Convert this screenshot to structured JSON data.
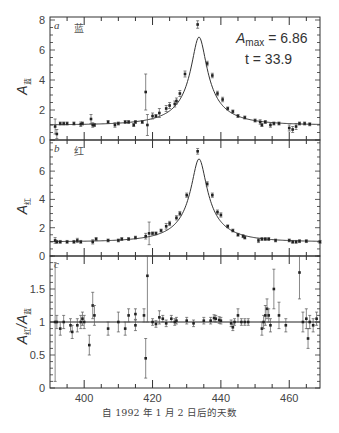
{
  "chart_data": {
    "type": "scatter",
    "xlabel": "自 1992 年 1 月 2 日后的天数",
    "xlim": [
      390,
      469
    ],
    "xticks": [
      400,
      420,
      440,
      460
    ],
    "panels": [
      {
        "id": "a",
        "panel_letter": "a",
        "band_label": "蓝",
        "ylabel_main": "A",
        "ylabel_sub": "蓝",
        "ylim": [
          0,
          8.2
        ],
        "yticks": [
          0,
          2,
          4,
          6,
          8
        ],
        "annotation": {
          "amax_label": "A",
          "amax_sub": "max",
          "amax_value": "= 6.86",
          "t_label": "t = 33.9"
        },
        "fit": {
          "t0": 433.6,
          "amax": 6.86,
          "tE": 33.9,
          "u_shape": "paczynski"
        },
        "points": [
          [
            391.5,
            0.9,
            0.5
          ],
          [
            392,
            0.4,
            0.3
          ],
          [
            393,
            1.1,
            0.1
          ],
          [
            394,
            1.1,
            0.1
          ],
          [
            395,
            1.1,
            0.1
          ],
          [
            397,
            1.1,
            0.1
          ],
          [
            399,
            1.05,
            0.15
          ],
          [
            399.5,
            1.1,
            0.1
          ],
          [
            402,
            1.4,
            0.3
          ],
          [
            402.5,
            1.0,
            0.15
          ],
          [
            403,
            1.0,
            0.1
          ],
          [
            407,
            1.2,
            0.1
          ],
          [
            409,
            1.0,
            0.15
          ],
          [
            410,
            1.1,
            0.1
          ],
          [
            412,
            1.2,
            0.1
          ],
          [
            413,
            1.2,
            0.1
          ],
          [
            414.5,
            1.0,
            0.1
          ],
          [
            415,
            1.2,
            0.1
          ],
          [
            417,
            1.2,
            0.1
          ],
          [
            418,
            3.2,
            1.2
          ],
          [
            418.5,
            1.0,
            0.7
          ],
          [
            420,
            1.6,
            0.2
          ],
          [
            421,
            1.6,
            0.1
          ],
          [
            422,
            1.8,
            0.3
          ],
          [
            424,
            2.1,
            0.2
          ],
          [
            425,
            2.3,
            0.2
          ],
          [
            426.5,
            2.4,
            0.2
          ],
          [
            427,
            2.6,
            0.2
          ],
          [
            428,
            3.1,
            0.2
          ],
          [
            429.5,
            4.4,
            0.2
          ],
          [
            433.2,
            7.7,
            0.25
          ],
          [
            436,
            5.1,
            0.15
          ],
          [
            437.5,
            4.3,
            0.15
          ],
          [
            439,
            3.1,
            0.15
          ],
          [
            440.5,
            2.7,
            0.15
          ],
          [
            442,
            2.1,
            0.1
          ],
          [
            443.5,
            1.9,
            0.1
          ],
          [
            445,
            1.6,
            0.1
          ],
          [
            447,
            1.5,
            0.1
          ],
          [
            450,
            1.3,
            0.1
          ],
          [
            451.5,
            1.2,
            0.15
          ],
          [
            452,
            1.0,
            0.1
          ],
          [
            453,
            1.2,
            0.1
          ],
          [
            454.5,
            1.0,
            0.15
          ],
          [
            455.5,
            1.1,
            0.1
          ],
          [
            457,
            1.1,
            0.1
          ],
          [
            460,
            0.8,
            0.2
          ],
          [
            461,
            0.7,
            0.2
          ],
          [
            462,
            0.9,
            0.2
          ],
          [
            463,
            1.1,
            0.1
          ],
          [
            464.5,
            1.1,
            0.1
          ],
          [
            466,
            1.05,
            0.1
          ]
        ]
      },
      {
        "id": "b",
        "panel_letter": "b",
        "band_label": "红",
        "ylabel_main": "A",
        "ylabel_sub": "红",
        "ylim": [
          0,
          8.2
        ],
        "yticks": [
          0,
          2,
          4,
          6
        ],
        "fit": {
          "t0": 433.6,
          "amax": 6.86,
          "tE": 33.9,
          "u_shape": "paczynski"
        },
        "points": [
          [
            391.5,
            1.1,
            0.2
          ],
          [
            392,
            1.0,
            0.1
          ],
          [
            393,
            1.0,
            0.1
          ],
          [
            395,
            1.0,
            0.1
          ],
          [
            397,
            1.0,
            0.1
          ],
          [
            398,
            1.1,
            0.15
          ],
          [
            399,
            1.0,
            0.1
          ],
          [
            402.5,
            1.0,
            0.15
          ],
          [
            403.5,
            1.2,
            0.1
          ],
          [
            407,
            1.1,
            0.1
          ],
          [
            410,
            1.1,
            0.1
          ],
          [
            411,
            1.2,
            0.1
          ],
          [
            413,
            1.2,
            0.1
          ],
          [
            415,
            1.3,
            0.1
          ],
          [
            418,
            1.4,
            0.2
          ],
          [
            419,
            1.6,
            0.8
          ],
          [
            420,
            1.6,
            0.1
          ],
          [
            421,
            1.6,
            0.1
          ],
          [
            422.5,
            1.8,
            0.1
          ],
          [
            424,
            2.1,
            0.2
          ],
          [
            425,
            2.3,
            0.15
          ],
          [
            427,
            2.7,
            0.15
          ],
          [
            428,
            3.0,
            0.15
          ],
          [
            430,
            4.3,
            0.15
          ],
          [
            433.2,
            7.4,
            0.2
          ],
          [
            436,
            5.1,
            0.15
          ],
          [
            437.5,
            4.3,
            0.15
          ],
          [
            439,
            3.1,
            0.15
          ],
          [
            440,
            2.9,
            0.15
          ],
          [
            442,
            2.1,
            0.1
          ],
          [
            443.5,
            1.8,
            0.1
          ],
          [
            445,
            1.5,
            0.1
          ],
          [
            446.5,
            1.4,
            0.1
          ],
          [
            447,
            1.3,
            0.1
          ],
          [
            451,
            1.1,
            0.15
          ],
          [
            452,
            1.2,
            0.1
          ],
          [
            453,
            1.2,
            0.1
          ],
          [
            454,
            1.2,
            0.1
          ],
          [
            456,
            1.1,
            0.1
          ],
          [
            460,
            1.1,
            0.1
          ],
          [
            461,
            1.0,
            0.1
          ],
          [
            462,
            1.0,
            0.1
          ],
          [
            463,
            1.05,
            0.1
          ],
          [
            465,
            1.05,
            0.1
          ],
          [
            469,
            1.0,
            0.1
          ]
        ]
      },
      {
        "id": "c",
        "panel_letter": "c",
        "ylabel_main": "A",
        "ylabel_sub": "红",
        "ylabel_sep": "/",
        "ylabel_main2": "A",
        "ylabel_sub2": "蓝",
        "ylim": [
          0,
          2.0
        ],
        "yticks": [
          0,
          0.5,
          1,
          1.5
        ],
        "ytick_labels": [
          "0",
          "0.5",
          "1",
          "1.5"
        ],
        "reference_line": 1,
        "points": [
          [
            391.5,
            1.0,
            0.9
          ],
          [
            392,
            1.0,
            0.1
          ],
          [
            393,
            0.9,
            0.1
          ],
          [
            394,
            1.0,
            0.1
          ],
          [
            396,
            0.95,
            0.1
          ],
          [
            396.5,
            0.85,
            0.1
          ],
          [
            398,
            0.95,
            0.1
          ],
          [
            399,
            1.0,
            0.1
          ],
          [
            399.5,
            1.05,
            0.1
          ],
          [
            400,
            1.0,
            0.1
          ],
          [
            401.5,
            0.65,
            0.15
          ],
          [
            402.5,
            1.25,
            0.2
          ],
          [
            403,
            1.1,
            0.15
          ],
          [
            407,
            0.9,
            0.1
          ],
          [
            410,
            1.0,
            0.15
          ],
          [
            412,
            0.9,
            0.1
          ],
          [
            413,
            1.1,
            0.1
          ],
          [
            415,
            1.12,
            0.08
          ],
          [
            415,
            0.95,
            0.08
          ],
          [
            417.5,
            1.1,
            0.1
          ],
          [
            418,
            0.45,
            0.3
          ],
          [
            418.5,
            1.7,
            0.7
          ],
          [
            420,
            1.0,
            0.05
          ],
          [
            421,
            0.97,
            0.05
          ],
          [
            422,
            1.07,
            0.1
          ],
          [
            423,
            1.05,
            0.05
          ],
          [
            424,
            0.98,
            0.05
          ],
          [
            425.5,
            1.05,
            0.05
          ],
          [
            426.5,
            1.0,
            0.05
          ],
          [
            427,
            1.02,
            0.05
          ],
          [
            430,
            1.02,
            0.05
          ],
          [
            432,
            0.98,
            0.05
          ],
          [
            435,
            1.02,
            0.05
          ],
          [
            437,
            1.02,
            0.05
          ],
          [
            438,
            1.06,
            0.05
          ],
          [
            438.5,
            1.05,
            0.05
          ],
          [
            439.5,
            1.03,
            0.05
          ],
          [
            440,
            1.02,
            0.05
          ],
          [
            443,
            0.98,
            0.05
          ],
          [
            443.5,
            0.92,
            0.05
          ],
          [
            444,
            1.0,
            0.05
          ],
          [
            445,
            1.1,
            0.1
          ],
          [
            446,
            1.0,
            0.05
          ],
          [
            447,
            1.0,
            0.05
          ],
          [
            448,
            1.0,
            0.05
          ],
          [
            452,
            0.9,
            0.1
          ],
          [
            452.5,
            1.0,
            0.1
          ],
          [
            453,
            1.1,
            0.15
          ],
          [
            453.5,
            1.2,
            0.15
          ],
          [
            454,
            1.1,
            0.1
          ],
          [
            454.5,
            0.95,
            0.1
          ],
          [
            455.5,
            1.5,
            0.3
          ],
          [
            457,
            1.1,
            0.2
          ],
          [
            459,
            0.95,
            0.1
          ],
          [
            463,
            1.75,
            0.4
          ],
          [
            464,
            1.0,
            0.15
          ],
          [
            465,
            1.05,
            0.15
          ],
          [
            465.5,
            0.75,
            0.15
          ],
          [
            466,
            1.0,
            0.1
          ],
          [
            467,
            0.95,
            0.1
          ],
          [
            468,
            1.05,
            0.1
          ]
        ]
      }
    ]
  }
}
